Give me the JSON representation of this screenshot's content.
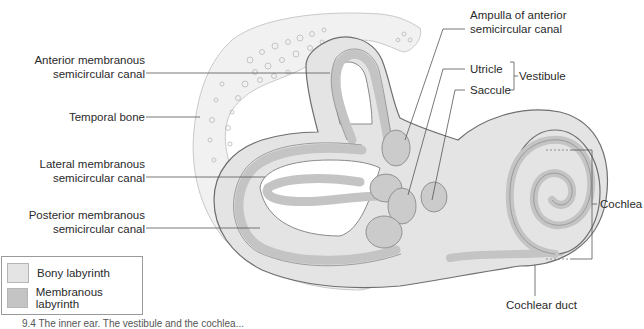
{
  "diagram": {
    "type": "anatomical-illustration",
    "colors": {
      "bony_labyrinth": "#e4e4e4",
      "membranous_labyrinth": "#c4c4c4",
      "temporal_bone": "#f1f1f1",
      "outline": "#6e6e6e",
      "leader_line": "#555555"
    },
    "labels_left": [
      {
        "id": "anterior",
        "line1": "Anterior membranous",
        "line2": "semicircular canal"
      },
      {
        "id": "temporal",
        "line1": "Temporal bone"
      },
      {
        "id": "lateral",
        "line1": "Lateral membranous",
        "line2": "semicircular canal"
      },
      {
        "id": "posterior",
        "line1": "Posterior membranous",
        "line2": "semicircular canal"
      }
    ],
    "labels_right": [
      {
        "id": "ampulla",
        "line1": "Ampulla of anterior",
        "line2": "semicircular canal"
      },
      {
        "id": "utricle",
        "line1": "Utricle"
      },
      {
        "id": "saccule",
        "line1": "Saccule"
      },
      {
        "id": "vestibule",
        "line1": "Vestibule"
      },
      {
        "id": "cochlea",
        "line1": "Cochlea"
      },
      {
        "id": "cochlear_duct",
        "line1": "Cochlear duct"
      }
    ],
    "legend": [
      {
        "label": "Bony labyrinth",
        "color": "#e4e4e4"
      },
      {
        "label": "Membranous labyrinth",
        "color": "#c4c4c4"
      }
    ],
    "caption_visible": "9.4 The inner ear. The vestibule and the cochlea..."
  }
}
